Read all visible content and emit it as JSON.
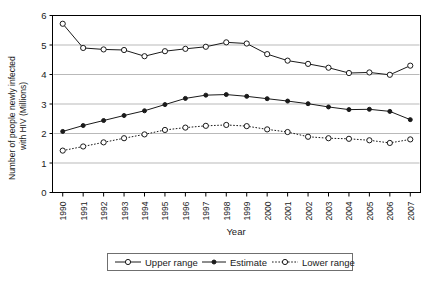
{
  "chart_data": {
    "type": "line",
    "title": "",
    "xlabel": "Year",
    "ylabel": "Number of people newly infected with HIV (Millions)",
    "ylabel_line1": "Number of people newly infected",
    "ylabel_line2": "with HIV (Millions)",
    "ylim": [
      0,
      6
    ],
    "yticks": [
      0,
      1,
      2,
      3,
      4,
      5,
      6
    ],
    "ytick_labels": [
      "0",
      "1",
      "2",
      "3",
      "4",
      "5",
      "6"
    ],
    "grid": true,
    "grid_axis": "y",
    "legend_position": "bottom",
    "categories": [
      1990,
      1991,
      1992,
      1993,
      1994,
      1995,
      1996,
      1997,
      1998,
      1999,
      2000,
      2001,
      2002,
      2003,
      2004,
      2005,
      2006,
      2007
    ],
    "xtick_labels": [
      "1990",
      "1991",
      "1992",
      "1993",
      "1994",
      "1995",
      "1996",
      "1997",
      "1998",
      "1999",
      "2000",
      "2001",
      "2002",
      "2003",
      "2004",
      "2005",
      "2006",
      "2007"
    ],
    "series": [
      {
        "name": "Upper range",
        "marker": "open-circle",
        "linestyle": "solid",
        "color": "#1a1a1a",
        "values": [
          5.72,
          4.9,
          4.85,
          4.83,
          4.62,
          4.79,
          4.87,
          4.94,
          5.09,
          5.05,
          4.69,
          4.47,
          4.36,
          4.23,
          4.05,
          4.07,
          3.99,
          4.3
        ]
      },
      {
        "name": "Estimate",
        "marker": "filled-circle",
        "linestyle": "solid",
        "color": "#1a1a1a",
        "values": [
          2.07,
          2.27,
          2.44,
          2.61,
          2.77,
          2.98,
          3.19,
          3.3,
          3.32,
          3.26,
          3.18,
          3.1,
          3.01,
          2.9,
          2.81,
          2.82,
          2.75,
          2.47
        ]
      },
      {
        "name": "Lower range",
        "marker": "open-circle",
        "linestyle": "dotted",
        "color": "#1a1a1a",
        "values": [
          1.42,
          1.56,
          1.7,
          1.84,
          1.97,
          2.12,
          2.2,
          2.26,
          2.29,
          2.25,
          2.14,
          2.05,
          1.89,
          1.84,
          1.82,
          1.77,
          1.68,
          1.8
        ]
      }
    ],
    "legend_entries": [
      {
        "label": "Upper range",
        "marker": "open-circle",
        "linestyle": "solid"
      },
      {
        "label": "Estimate",
        "marker": "filled-circle",
        "linestyle": "solid"
      },
      {
        "label": "Lower range",
        "marker": "open-circle",
        "linestyle": "dotted"
      }
    ]
  }
}
